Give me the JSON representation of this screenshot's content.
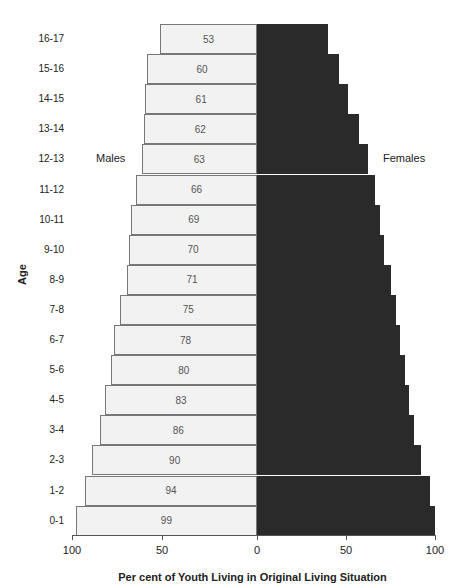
{
  "chart_data": {
    "type": "bar",
    "orientation": "horizontal",
    "subtype": "population-pyramid",
    "title": "",
    "xlabel": "Per cent of Youth Living in Original Living Situation",
    "ylabel": "Age",
    "categories": [
      "16-17",
      "15-16",
      "14-15",
      "13-14",
      "12-13",
      "11-12",
      "10-11",
      "9-10",
      "8-9",
      "7-8",
      "6-7",
      "5-6",
      "4-5",
      "3-4",
      "2-3",
      "1-2",
      "0-1"
    ],
    "series": [
      {
        "name": "Males",
        "side": "left",
        "color": "#f2f2f2",
        "labeled": true,
        "values": [
          53,
          60,
          61,
          62,
          63,
          66,
          69,
          70,
          71,
          75,
          78,
          80,
          83,
          86,
          90,
          94,
          99
        ]
      },
      {
        "name": "Females",
        "side": "right",
        "color": "#2a2a2a",
        "labeled": false,
        "values": [
          40,
          46,
          51,
          57,
          62,
          66,
          69,
          71,
          75,
          78,
          80,
          83,
          85,
          88,
          92,
          97,
          100
        ]
      }
    ],
    "xticks": [
      "100",
      "50",
      "0",
      "50",
      "100"
    ],
    "xlim": [
      -100,
      100
    ],
    "grid": false,
    "legend": "inline labels"
  },
  "labels": {
    "males": "Males",
    "females": "Females",
    "xlabel": "Per cent of Youth Living in Original Living Situation",
    "ylabel": "Age"
  }
}
